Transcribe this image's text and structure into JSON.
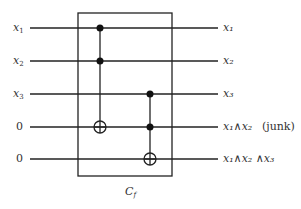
{
  "diagram": {
    "type": "quantum-circuit",
    "inputs": [
      {
        "var": "x",
        "sub": "1"
      },
      {
        "var": "x",
        "sub": "2"
      },
      {
        "var": "x",
        "sub": "3"
      },
      {
        "text": "0"
      },
      {
        "text": "0"
      }
    ],
    "outputs": [
      {
        "text": "x1",
        "display": "x₁"
      },
      {
        "text": "x2",
        "display": "x₂"
      },
      {
        "text": "x3",
        "display": "x₃"
      },
      {
        "text": "x1 ∧ x2",
        "display": "x₁∧x₂",
        "note": "(junk)"
      },
      {
        "text": "x1 ∧ x2 ∧ x3",
        "display": "x₁∧x₂ ∧x₃"
      }
    ],
    "gates": [
      {
        "type": "toffoli",
        "controls": [
          1,
          2
        ],
        "target": 4
      },
      {
        "type": "toffoli",
        "controls": [
          3,
          4
        ],
        "target": 5
      }
    ],
    "box_label": {
      "var": "C",
      "sub": "f"
    }
  }
}
